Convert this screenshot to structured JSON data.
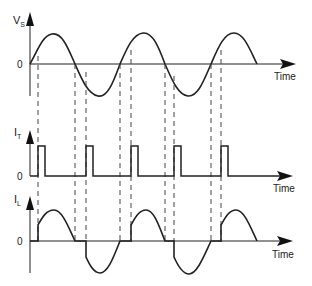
{
  "diagram": {
    "panels": [
      {
        "id": "vs",
        "axis_label": "V",
        "axis_subscript": "S",
        "zero_label": "0",
        "time_label": "Time"
      },
      {
        "id": "it",
        "axis_label": "I",
        "axis_subscript": "T",
        "zero_label": "0",
        "time_label": "Time"
      },
      {
        "id": "il",
        "axis_label": "I",
        "axis_subscript": "L",
        "zero_label": "0",
        "time_label": "Time"
      }
    ],
    "zero_crossings_x": [
      30,
      75,
      120,
      165,
      211,
      257
    ],
    "firing_points_x": [
      38,
      86,
      131,
      174,
      221
    ],
    "colors": {
      "trace": "#222222",
      "dashed": "#444444",
      "axis": "#222222"
    }
  }
}
